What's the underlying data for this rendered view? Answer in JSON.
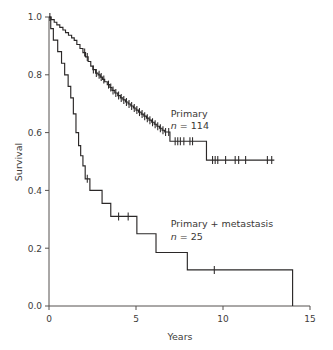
{
  "chart_data": {
    "type": "line",
    "subtype": "kaplan-meier-survival",
    "title": "",
    "xlabel": "Years",
    "ylabel": "Survival",
    "xlim": [
      0,
      15
    ],
    "ylim": [
      0,
      1.0
    ],
    "xticks": [
      0,
      5,
      10,
      15
    ],
    "xtick_labels": [
      "0",
      "5",
      "10",
      "15"
    ],
    "yticks": [
      0.0,
      0.2,
      0.4,
      0.6,
      0.8,
      1.0
    ],
    "ytick_labels": [
      "0.0",
      "0.2",
      "0.4",
      "0.6",
      "0.8",
      "1.0"
    ],
    "grid": false,
    "legend_position": "inline-annotation",
    "series": [
      {
        "name": "Primary",
        "n_label": "n = 114",
        "n": 114,
        "color": "#2b2828",
        "annotation_x": 7.0,
        "annotation_y": 0.655,
        "steps": [
          [
            0.0,
            1.0
          ],
          [
            0.12,
            0.991
          ],
          [
            0.3,
            0.982
          ],
          [
            0.45,
            0.973
          ],
          [
            0.62,
            0.964
          ],
          [
            0.8,
            0.955
          ],
          [
            0.95,
            0.946
          ],
          [
            1.12,
            0.937
          ],
          [
            1.3,
            0.928
          ],
          [
            1.45,
            0.919
          ],
          [
            1.6,
            0.905
          ],
          [
            1.78,
            0.891
          ],
          [
            1.95,
            0.877
          ],
          [
            2.1,
            0.862
          ],
          [
            2.25,
            0.846
          ],
          [
            2.4,
            0.83
          ],
          [
            2.52,
            0.818
          ],
          [
            2.68,
            0.806
          ],
          [
            2.82,
            0.8
          ],
          [
            2.95,
            0.792
          ],
          [
            3.08,
            0.784
          ],
          [
            3.2,
            0.776
          ],
          [
            3.35,
            0.766
          ],
          [
            3.5,
            0.756
          ],
          [
            3.62,
            0.746
          ],
          [
            3.78,
            0.737
          ],
          [
            3.95,
            0.728
          ],
          [
            4.1,
            0.72
          ],
          [
            4.25,
            0.713
          ],
          [
            4.4,
            0.706
          ],
          [
            4.55,
            0.699
          ],
          [
            4.7,
            0.692
          ],
          [
            4.85,
            0.685
          ],
          [
            5.0,
            0.678
          ],
          [
            5.15,
            0.671
          ],
          [
            5.3,
            0.664
          ],
          [
            5.45,
            0.657
          ],
          [
            5.6,
            0.65
          ],
          [
            5.75,
            0.643
          ],
          [
            5.9,
            0.636
          ],
          [
            6.05,
            0.629
          ],
          [
            6.2,
            0.622
          ],
          [
            6.35,
            0.615
          ],
          [
            6.5,
            0.608
          ],
          [
            6.65,
            0.602
          ],
          [
            6.82,
            0.602
          ],
          [
            6.95,
            0.57
          ],
          [
            7.1,
            0.57
          ],
          [
            9.0,
            0.57
          ],
          [
            9.05,
            0.505
          ],
          [
            12.95,
            0.505
          ]
        ],
        "censor_marks": [
          [
            0.05,
            1.0
          ],
          [
            2.05,
            0.877
          ],
          [
            2.2,
            0.862
          ],
          [
            2.55,
            0.818
          ],
          [
            2.72,
            0.806
          ],
          [
            2.88,
            0.8
          ],
          [
            3.0,
            0.792
          ],
          [
            3.15,
            0.784
          ],
          [
            3.42,
            0.766
          ],
          [
            3.55,
            0.756
          ],
          [
            3.68,
            0.746
          ],
          [
            3.84,
            0.737
          ],
          [
            4.0,
            0.728
          ],
          [
            4.15,
            0.72
          ],
          [
            4.3,
            0.713
          ],
          [
            4.45,
            0.706
          ],
          [
            4.6,
            0.699
          ],
          [
            4.75,
            0.692
          ],
          [
            4.9,
            0.685
          ],
          [
            5.05,
            0.678
          ],
          [
            5.2,
            0.671
          ],
          [
            5.35,
            0.664
          ],
          [
            5.5,
            0.657
          ],
          [
            5.65,
            0.65
          ],
          [
            5.8,
            0.643
          ],
          [
            5.95,
            0.636
          ],
          [
            6.1,
            0.629
          ],
          [
            6.25,
            0.622
          ],
          [
            6.4,
            0.615
          ],
          [
            6.55,
            0.608
          ],
          [
            6.7,
            0.602
          ],
          [
            6.88,
            0.602
          ],
          [
            7.25,
            0.57
          ],
          [
            7.4,
            0.57
          ],
          [
            7.55,
            0.57
          ],
          [
            7.75,
            0.57
          ],
          [
            8.1,
            0.57
          ],
          [
            8.25,
            0.57
          ],
          [
            9.4,
            0.505
          ],
          [
            9.55,
            0.505
          ],
          [
            9.7,
            0.505
          ],
          [
            10.15,
            0.505
          ],
          [
            10.7,
            0.505
          ],
          [
            10.9,
            0.505
          ],
          [
            11.3,
            0.505
          ],
          [
            12.55,
            0.505
          ],
          [
            12.8,
            0.505
          ]
        ]
      },
      {
        "name": "Primary + metastasis",
        "n_label": "n = 25",
        "n": 25,
        "color": "#2b2828",
        "annotation_x": 7.0,
        "annotation_y": 0.272,
        "steps": [
          [
            0.0,
            1.0
          ],
          [
            0.1,
            0.96
          ],
          [
            0.25,
            0.92
          ],
          [
            0.5,
            0.88
          ],
          [
            0.72,
            0.84
          ],
          [
            0.9,
            0.8
          ],
          [
            1.1,
            0.76
          ],
          [
            1.25,
            0.72
          ],
          [
            1.4,
            0.665
          ],
          [
            1.55,
            0.6
          ],
          [
            1.7,
            0.555
          ],
          [
            1.82,
            0.52
          ],
          [
            1.95,
            0.485
          ],
          [
            2.08,
            0.44
          ],
          [
            2.35,
            0.4
          ],
          [
            3.0,
            0.4
          ],
          [
            3.05,
            0.355
          ],
          [
            3.5,
            0.355
          ],
          [
            3.55,
            0.31
          ],
          [
            5.0,
            0.31
          ],
          [
            5.05,
            0.25
          ],
          [
            6.1,
            0.25
          ],
          [
            6.15,
            0.185
          ],
          [
            7.9,
            0.185
          ],
          [
            7.95,
            0.125
          ],
          [
            13.95,
            0.125
          ],
          [
            14.0,
            0.0
          ]
        ],
        "censor_marks": [
          [
            2.2,
            0.44
          ],
          [
            4.0,
            0.31
          ],
          [
            4.55,
            0.31
          ],
          [
            9.5,
            0.125
          ]
        ]
      }
    ]
  },
  "axes": {
    "ylabel": "Survival",
    "xlabel": "Years"
  }
}
